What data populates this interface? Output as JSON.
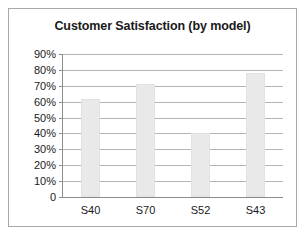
{
  "frame": {
    "border_color": "#a8a8a8",
    "background_color": "#ffffff"
  },
  "chart_data": {
    "type": "bar",
    "title": "Customer Satisfaction (by model)",
    "xlabel": "",
    "ylabel": "",
    "categories": [
      "S40",
      "S70",
      "S52",
      "S43"
    ],
    "values": [
      62,
      71,
      40,
      78
    ],
    "ylim": [
      0,
      90
    ],
    "ytick_values": [
      0,
      10,
      20,
      30,
      40,
      50,
      60,
      70,
      80,
      90
    ],
    "ytick_labels": [
      "0",
      "10%",
      "20%",
      "30%",
      "40%",
      "50%",
      "60%",
      "70%",
      "80%",
      "90%"
    ],
    "grid": true,
    "legend": false,
    "legend_position": "none",
    "bar_color": "#e9e9e9",
    "gridline_color": "#b4b4b4",
    "axis_color": "#8c8c8c",
    "text_color": "#1a1a1a"
  }
}
